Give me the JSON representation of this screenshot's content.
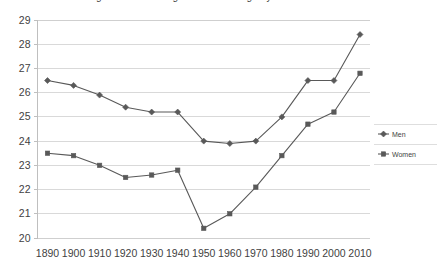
{
  "chart_data": {
    "type": "line",
    "title": "Figure 1. Median age at first marriage by sex: 1890 to 2010",
    "xlabel": "",
    "ylabel": "",
    "categories": [
      "1890",
      "1900",
      "1910",
      "1920",
      "1930",
      "1940",
      "1950",
      "1960",
      "1970",
      "1980",
      "1990",
      "2000",
      "2010"
    ],
    "x": [
      1890,
      1900,
      1910,
      1920,
      1930,
      1940,
      1950,
      1960,
      1970,
      1980,
      1990,
      2000,
      2010
    ],
    "series": [
      {
        "name": "Men",
        "marker": "diamond",
        "color": "#595959",
        "values": [
          26.5,
          26.3,
          25.9,
          25.4,
          25.2,
          25.2,
          24.0,
          23.9,
          24.0,
          25.0,
          26.5,
          26.5,
          28.4
        ]
      },
      {
        "name": "Women",
        "marker": "square",
        "color": "#595959",
        "values": [
          23.5,
          23.4,
          23.0,
          22.5,
          22.6,
          22.8,
          20.4,
          21.0,
          22.1,
          23.4,
          24.7,
          25.2,
          26.8
        ]
      }
    ],
    "ylim": [
      20,
      29
    ],
    "yticks": [
      20,
      21,
      22,
      23,
      24,
      25,
      26,
      27,
      28,
      29
    ],
    "ytick_labels": [
      "20",
      "21",
      "22",
      "23",
      "24",
      "25",
      "26",
      "27",
      "28",
      "29"
    ],
    "grid": true,
    "grid_color": "#d9d9d9",
    "legend_position": "right",
    "legend": [
      "Men",
      "Women"
    ],
    "background": "#ffffff"
  }
}
